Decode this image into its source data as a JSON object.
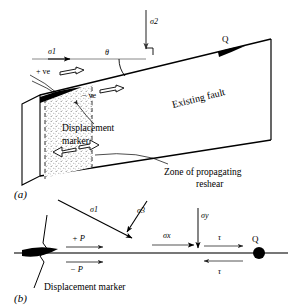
{
  "figure": {
    "type": "structural-geology-diagram",
    "panels": [
      {
        "id": "a",
        "label": "(a)"
      },
      {
        "id": "b",
        "label": "(b)"
      }
    ]
  },
  "panel_a": {
    "stress_sigma2": "σ2",
    "stress_sigma1": "σ1",
    "angle_theta": "θ",
    "point_q": "Q",
    "plus_ve": "+ ve",
    "minus_ve": "− ve",
    "existing_fault": "Existing  fault",
    "displacement_marker_line1": "Displacement",
    "displacement_marker_line2": "marker",
    "zone_line1": "Zone of propagating",
    "zone_line2": "reshear",
    "panel_label": "(a)"
  },
  "panel_b": {
    "stress_sigma1": "σ1",
    "stress_sigma3": "σ3",
    "stress_sigma_y": "σy",
    "stress_sigma_x": "σx",
    "tau_top": "τ",
    "tau_bottom": "τ",
    "plus_p": "+ P",
    "minus_p": "− P",
    "point_q": "Q",
    "displacement_marker": "Displacement  marker",
    "panel_label": "(b)"
  },
  "colors": {
    "ink": "#000000",
    "line_gray": "#444444",
    "stipple": "#9a9a9a",
    "background": "#ffffff"
  }
}
